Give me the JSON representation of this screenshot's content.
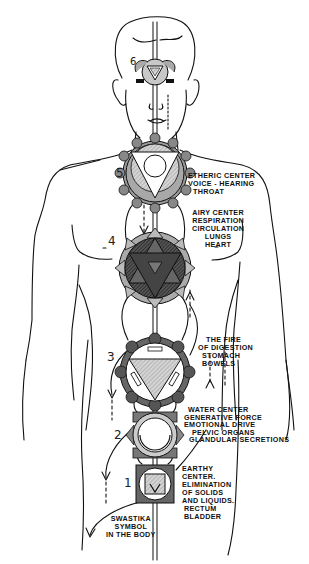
{
  "diagram": {
    "type": "anatomical-energy-centers",
    "centers": [
      {
        "number": "6",
        "lines": []
      },
      {
        "number": "5",
        "lines": [
          "ETHERIC CENTER",
          "VOICE - HEARING",
          "THROAT"
        ]
      },
      {
        "number": "4",
        "lines": [
          "AIRY CENTER",
          "RESPIRATION",
          "CIRCULATION",
          "LUNGS",
          "HEART"
        ]
      },
      {
        "number": "3",
        "lines": [
          "THE FIRE",
          "OF DIGESTION",
          "STOMACH",
          "BOWELS"
        ]
      },
      {
        "number": "2",
        "lines": [
          "WATER CENTER",
          "GENERATIVE FORCE",
          "EMOTIONAL DRIVE",
          "PELVIC ORGANS",
          "GLANDULAR SECRETIONS"
        ]
      },
      {
        "number": "1",
        "lines": [
          "EARTHY",
          "CENTER.",
          "ELIMINATION",
          "OF SOLIDS",
          "AND LIQUIDS.",
          "RECTUM",
          "BLADDER"
        ]
      }
    ],
    "annotation": {
      "lines": [
        "SWASTIKA",
        "SYMBOL",
        "IN THE BODY"
      ]
    },
    "colors": {
      "ink": "#111111",
      "shade": "#9a9a9a",
      "light_shade": "#cfcfcf",
      "dark_shade": "#444444",
      "background": "#ffffff"
    }
  }
}
